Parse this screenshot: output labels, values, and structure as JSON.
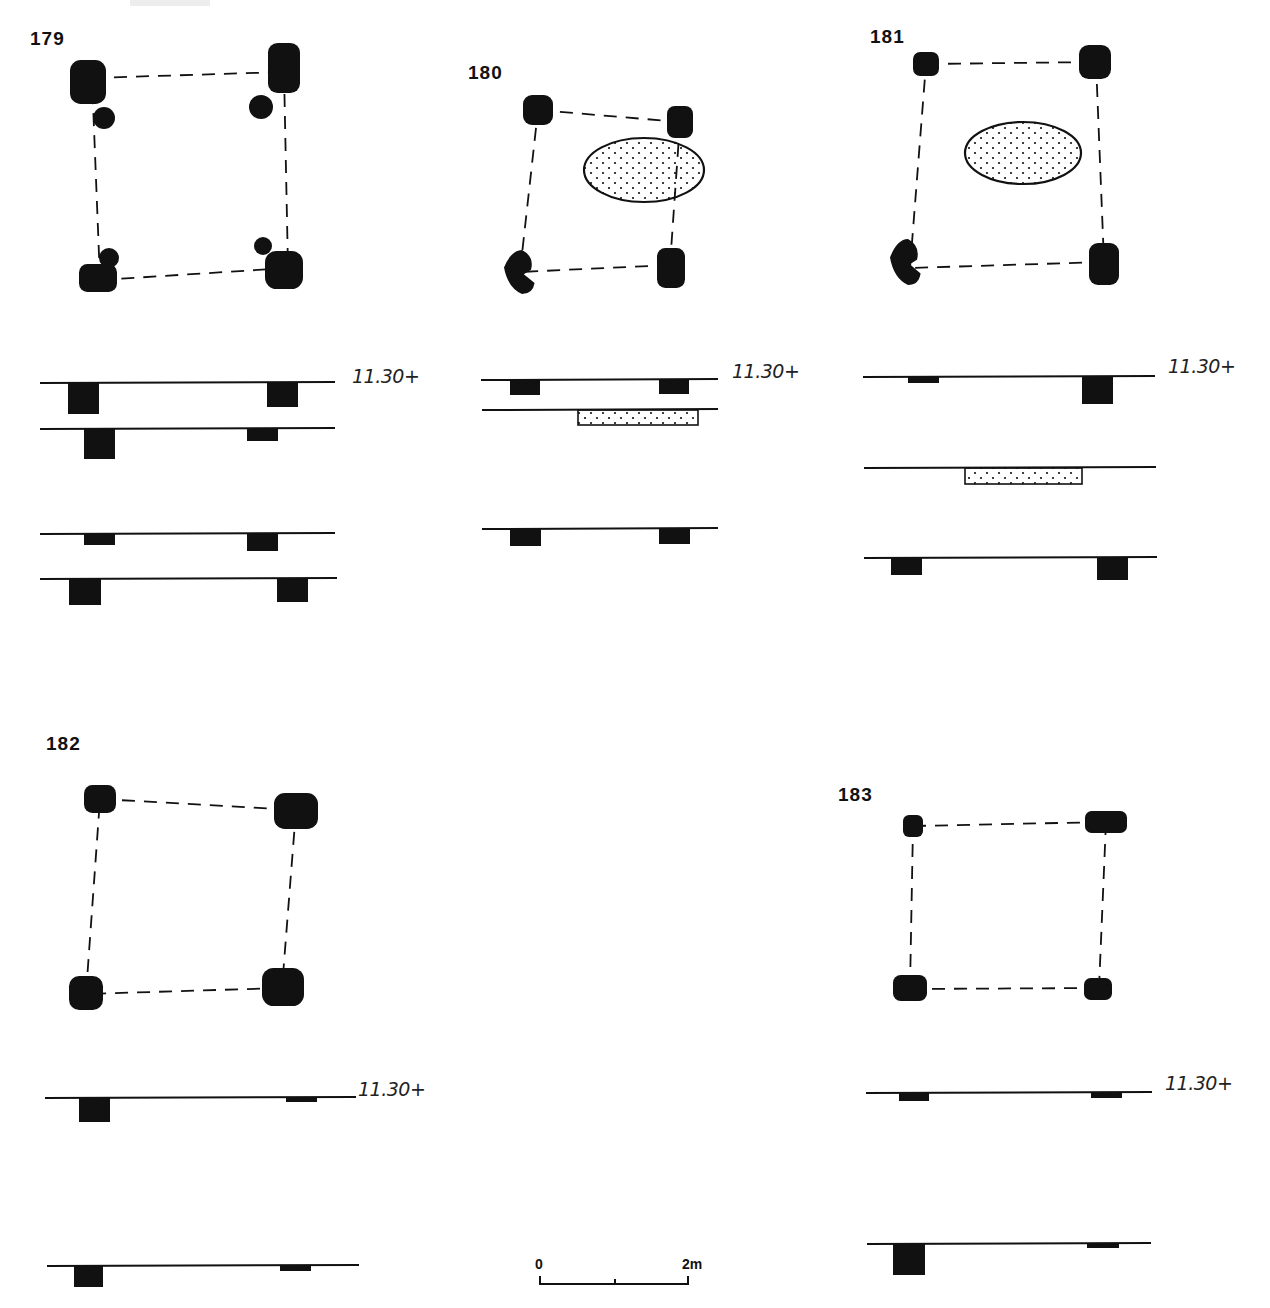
{
  "figure": {
    "ink_color": "#111111",
    "stipple_color": "#111111",
    "elevation_label": "11.30+",
    "structures": [
      {
        "id": "179",
        "label": "179",
        "label_pos": [
          30,
          46
        ],
        "plan": {
          "corners": [
            [
              92,
              78
            ],
            [
              284,
              72
            ],
            [
              288,
              268
            ],
            [
              100,
              280
            ]
          ],
          "posts": [
            {
              "type": "blob",
              "cx": 88,
              "cy": 82,
              "rx": 18,
              "ry": 22
            },
            {
              "type": "blob",
              "cx": 284,
              "cy": 68,
              "rx": 16,
              "ry": 25
            },
            {
              "type": "blob",
              "cx": 98,
              "cy": 278,
              "rx": 19,
              "ry": 14
            },
            {
              "type": "blob",
              "cx": 284,
              "cy": 270,
              "rx": 19,
              "ry": 19
            },
            {
              "type": "small",
              "cx": 104,
              "cy": 118,
              "r": 11
            },
            {
              "type": "small",
              "cx": 261,
              "cy": 107,
              "r": 12
            },
            {
              "type": "small",
              "cx": 109,
              "cy": 258,
              "r": 10
            },
            {
              "type": "small",
              "cx": 263,
              "cy": 246,
              "r": 9
            }
          ],
          "pit": null
        },
        "sections": [
          {
            "y": 383,
            "x1": 40,
            "x2": 335,
            "fills": [
              {
                "x": 68,
                "w": 31,
                "d": 31,
                "kind": "solid"
              },
              {
                "x": 267,
                "w": 31,
                "d": 24,
                "kind": "solid"
              }
            ]
          },
          {
            "y": 429,
            "x1": 40,
            "x2": 335,
            "fills": [
              {
                "x": 84,
                "w": 31,
                "d": 30,
                "kind": "solid"
              },
              {
                "x": 247,
                "w": 31,
                "d": 12,
                "kind": "solid"
              }
            ]
          },
          {
            "y": 534,
            "x1": 40,
            "x2": 335,
            "fills": [
              {
                "x": 84,
                "w": 31,
                "d": 11,
                "kind": "solid"
              },
              {
                "x": 247,
                "w": 31,
                "d": 17,
                "kind": "solid"
              }
            ]
          },
          {
            "y": 579,
            "x1": 40,
            "x2": 337,
            "fills": [
              {
                "x": 69,
                "w": 32,
                "d": 26,
                "kind": "solid"
              },
              {
                "x": 277,
                "w": 31,
                "d": 23,
                "kind": "solid"
              }
            ]
          }
        ],
        "elev_pos": [
          352,
          365
        ]
      },
      {
        "id": "180",
        "label": "180",
        "label_pos": [
          468,
          80
        ],
        "plan": {
          "corners": [
            [
              538,
              110
            ],
            [
              680,
              122
            ],
            [
              670,
              265
            ],
            [
              520,
              272
            ]
          ],
          "posts": [
            {
              "type": "blob",
              "cx": 538,
              "cy": 110,
              "rx": 15,
              "ry": 15
            },
            {
              "type": "blob",
              "cx": 680,
              "cy": 122,
              "rx": 13,
              "ry": 16
            },
            {
              "type": "bent",
              "cx": 522,
              "cy": 272,
              "rx": 18,
              "ry": 22
            },
            {
              "type": "blob",
              "cx": 671,
              "cy": 268,
              "rx": 14,
              "ry": 20
            }
          ],
          "pit": {
            "cx": 644,
            "cy": 170,
            "rx": 60,
            "ry": 32
          }
        },
        "sections": [
          {
            "y": 380,
            "x1": 481,
            "x2": 718,
            "fills": [
              {
                "x": 510,
                "w": 30,
                "d": 15,
                "kind": "solid"
              },
              {
                "x": 659,
                "w": 30,
                "d": 14,
                "kind": "solid"
              }
            ]
          },
          {
            "y": 410,
            "x1": 482,
            "x2": 718,
            "fills": [
              {
                "x": 578,
                "w": 120,
                "d": 15,
                "kind": "stipple"
              }
            ]
          },
          {
            "y": 529,
            "x1": 482,
            "x2": 718,
            "fills": [
              {
                "x": 510,
                "w": 31,
                "d": 17,
                "kind": "solid"
              },
              {
                "x": 659,
                "w": 31,
                "d": 15,
                "kind": "solid"
              }
            ]
          }
        ],
        "elev_pos": [
          732,
          360
        ]
      },
      {
        "id": "181",
        "label": "181",
        "label_pos": [
          870,
          44
        ],
        "plan": {
          "corners": [
            [
              926,
              64
            ],
            [
              1096,
              62
            ],
            [
              1104,
              262
            ],
            [
              910,
              268
            ]
          ],
          "posts": [
            {
              "type": "blob",
              "cx": 926,
              "cy": 64,
              "rx": 13,
              "ry": 12
            },
            {
              "type": "blob",
              "cx": 1095,
              "cy": 62,
              "rx": 16,
              "ry": 17
            },
            {
              "type": "bent",
              "cx": 908,
              "cy": 262,
              "rx": 18,
              "ry": 23
            },
            {
              "type": "blob",
              "cx": 1104,
              "cy": 264,
              "rx": 15,
              "ry": 21
            }
          ],
          "pit": {
            "cx": 1023,
            "cy": 153,
            "rx": 58,
            "ry": 31
          }
        },
        "sections": [
          {
            "y": 377,
            "x1": 863,
            "x2": 1155,
            "fills": [
              {
                "x": 908,
                "w": 31,
                "d": 6,
                "kind": "solid"
              },
              {
                "x": 1082,
                "w": 31,
                "d": 27,
                "kind": "solid"
              }
            ]
          },
          {
            "y": 468,
            "x1": 864,
            "x2": 1156,
            "fills": [
              {
                "x": 965,
                "w": 117,
                "d": 16,
                "kind": "stipple"
              }
            ]
          },
          {
            "y": 558,
            "x1": 864,
            "x2": 1157,
            "fills": [
              {
                "x": 891,
                "w": 31,
                "d": 17,
                "kind": "solid"
              },
              {
                "x": 1097,
                "w": 31,
                "d": 22,
                "kind": "solid"
              }
            ]
          }
        ],
        "elev_pos": [
          1168,
          355
        ]
      },
      {
        "id": "182",
        "label": "182",
        "label_pos": [
          46,
          751
        ],
        "plan": {
          "corners": [
            [
              100,
              799
            ],
            [
              296,
              810
            ],
            [
              282,
              988
            ],
            [
              86,
              994
            ]
          ],
          "posts": [
            {
              "type": "blob",
              "cx": 100,
              "cy": 799,
              "rx": 16,
              "ry": 14
            },
            {
              "type": "blob",
              "cx": 296,
              "cy": 811,
              "rx": 22,
              "ry": 18
            },
            {
              "type": "blob",
              "cx": 86,
              "cy": 993,
              "rx": 17,
              "ry": 17
            },
            {
              "type": "blob",
              "cx": 283,
              "cy": 987,
              "rx": 21,
              "ry": 19
            }
          ],
          "pit": null
        },
        "sections": [
          {
            "y": 1098,
            "x1": 45,
            "x2": 356,
            "fills": [
              {
                "x": 79,
                "w": 31,
                "d": 24,
                "kind": "solid"
              },
              {
                "x": 286,
                "w": 31,
                "d": 4,
                "kind": "solid"
              }
            ]
          },
          {
            "y": 1266,
            "x1": 47,
            "x2": 359,
            "fills": [
              {
                "x": 74,
                "w": 29,
                "d": 21,
                "kind": "solid"
              },
              {
                "x": 280,
                "w": 31,
                "d": 5,
                "kind": "solid"
              }
            ]
          }
        ],
        "elev_pos": [
          358,
          1078
        ]
      },
      {
        "id": "183",
        "label": "183",
        "label_pos": [
          838,
          802
        ],
        "plan": {
          "corners": [
            [
              913,
              826
            ],
            [
              1106,
              822
            ],
            [
              1099,
              988
            ],
            [
              910,
              989
            ]
          ],
          "posts": [
            {
              "type": "blob",
              "cx": 913,
              "cy": 826,
              "rx": 10,
              "ry": 11
            },
            {
              "type": "blob",
              "cx": 1106,
              "cy": 822,
              "rx": 21,
              "ry": 11
            },
            {
              "type": "blob",
              "cx": 910,
              "cy": 988,
              "rx": 17,
              "ry": 13
            },
            {
              "type": "blob",
              "cx": 1098,
              "cy": 989,
              "rx": 14,
              "ry": 11
            }
          ],
          "pit": null
        },
        "sections": [
          {
            "y": 1093,
            "x1": 866,
            "x2": 1152,
            "fills": [
              {
                "x": 899,
                "w": 30,
                "d": 8,
                "kind": "solid"
              },
              {
                "x": 1091,
                "w": 31,
                "d": 5,
                "kind": "solid"
              }
            ]
          },
          {
            "y": 1244,
            "x1": 867,
            "x2": 1151,
            "fills": [
              {
                "x": 893,
                "w": 32,
                "d": 31,
                "kind": "solid"
              },
              {
                "x": 1087,
                "w": 32,
                "d": 4,
                "kind": "solid"
              }
            ]
          }
        ],
        "elev_pos": [
          1165,
          1072
        ]
      }
    ],
    "scale_bar": {
      "start_label": "0",
      "end_label": "2m",
      "x1": 540,
      "x2": 688,
      "y": 1284,
      "mid_tick_x": 615
    }
  }
}
